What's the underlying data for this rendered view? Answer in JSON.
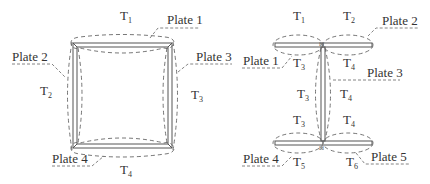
{
  "figure_left": {
    "title": "closed square frame",
    "plates": [
      {
        "label": "Plate 1"
      },
      {
        "label": "Plate 2"
      },
      {
        "label": "Plate 3"
      },
      {
        "label": "Plate 4"
      }
    ],
    "regions": [
      {
        "base": "T",
        "sub": "1"
      },
      {
        "base": "T",
        "sub": "2"
      },
      {
        "base": "T",
        "sub": "3"
      },
      {
        "base": "T",
        "sub": "4"
      }
    ]
  },
  "figure_right": {
    "title": "I-shaped frame",
    "plates": [
      {
        "label": "Plate 1"
      },
      {
        "label": "Plate 2"
      },
      {
        "label": "Plate 3"
      },
      {
        "label": "Plate 4"
      },
      {
        "label": "Plate 5"
      }
    ],
    "regions": [
      {
        "base": "T",
        "sub": "1"
      },
      {
        "base": "T",
        "sub": "2"
      },
      {
        "base": "T",
        "sub": "3"
      },
      {
        "base": "T",
        "sub": "4"
      },
      {
        "base": "T",
        "sub": "3"
      },
      {
        "base": "T",
        "sub": "4"
      },
      {
        "base": "T",
        "sub": "3"
      },
      {
        "base": "T",
        "sub": "4"
      },
      {
        "base": "T",
        "sub": "5"
      },
      {
        "base": "T",
        "sub": "6"
      }
    ]
  },
  "colors": {
    "line": "#555555",
    "dashed": "#666666",
    "text": "#333333",
    "background": "#ffffff"
  }
}
